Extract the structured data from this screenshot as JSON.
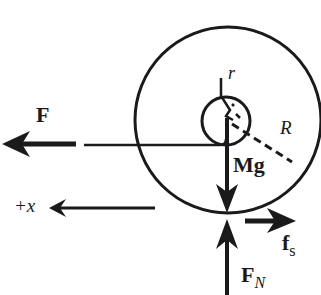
{
  "diagram": {
    "type": "free-body diagram",
    "labels": {
      "applied_force": "F",
      "weight": "Mg",
      "normal_force_main": "F",
      "normal_force_sub": "N",
      "friction_main": "f",
      "friction_sub": "s",
      "inner_radius": "r",
      "outer_radius": "R",
      "axis_direction": "+x"
    },
    "colors": {
      "stroke": "#1a1a1a",
      "background": "#ffffff"
    }
  }
}
